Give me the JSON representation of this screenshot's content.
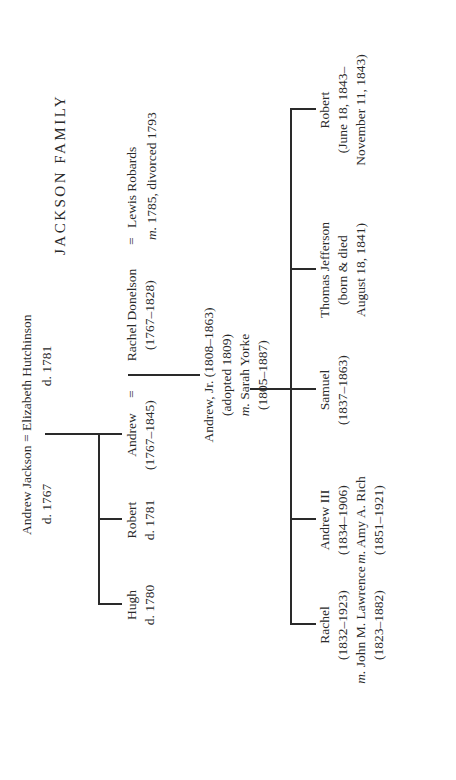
{
  "title": "JACKSON FAMILY",
  "parents": {
    "father": "Andrew Jackson",
    "father_dates": "d. 1767",
    "marriage_sign": "=",
    "mother": "Elizabeth Hutchinson",
    "mother_dates": "d. 1781"
  },
  "generation1": [
    {
      "name": "Hugh",
      "dates": "d. 1780"
    },
    {
      "name": "Robert",
      "dates": "d. 1781"
    },
    {
      "name": "Andrew",
      "dates": "(1767–1845)"
    }
  ],
  "spouse": {
    "marriage_sign": "=",
    "name": "Rachel Donelson",
    "dates": "(1767–1828)",
    "prior_marriage_sign": "=",
    "prior_spouse": "Lewis Robards",
    "prior_marriage_prefix": "m.",
    "prior_marriage_note": "1785, divorced 1793"
  },
  "adopted_son": {
    "name": "Andrew, Jr. (1808–1863)",
    "note": "(adopted 1809)",
    "marriage_prefix": "m.",
    "spouse": "Sarah Yorke",
    "spouse_dates": "(1805–1887)"
  },
  "generation3": [
    {
      "name": "Rachel",
      "dates": "(1832–1923)",
      "marriage_prefix": "m.",
      "spouse": "John M. Lawrence",
      "spouse_dates": "(1823–1882)"
    },
    {
      "name": "Andrew III",
      "dates": "(1834–1906)",
      "marriage_prefix": "m.",
      "spouse": "Amy A. Rich",
      "spouse_dates": "(1851–1921)"
    },
    {
      "name": "Samuel",
      "dates": "(1837–1863)"
    },
    {
      "name": "Thomas Jefferson",
      "dates": "(born & died",
      "dates2": "August 18, 1841)"
    },
    {
      "name": "Robert",
      "dates": "(June 18, 1843–",
      "dates2": "November 11, 1843)"
    }
  ]
}
